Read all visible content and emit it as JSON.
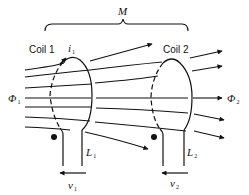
{
  "diagram": {
    "title_symbol": "M",
    "coil1": {
      "label": "Coil 1",
      "current": "i",
      "current_sub": "1",
      "inductance": "L",
      "inductance_sub": "1",
      "voltage": "v",
      "voltage_sub": "1"
    },
    "coil2": {
      "label": "Coil 2",
      "inductance": "L",
      "inductance_sub": "2",
      "voltage": "v",
      "voltage_sub": "2"
    },
    "flux1": {
      "symbol": "Φ",
      "sub": "1"
    },
    "flux2": {
      "symbol": "Φ",
      "sub": "2"
    },
    "colors": {
      "ink": "#111111",
      "background": "#ffffff"
    }
  }
}
